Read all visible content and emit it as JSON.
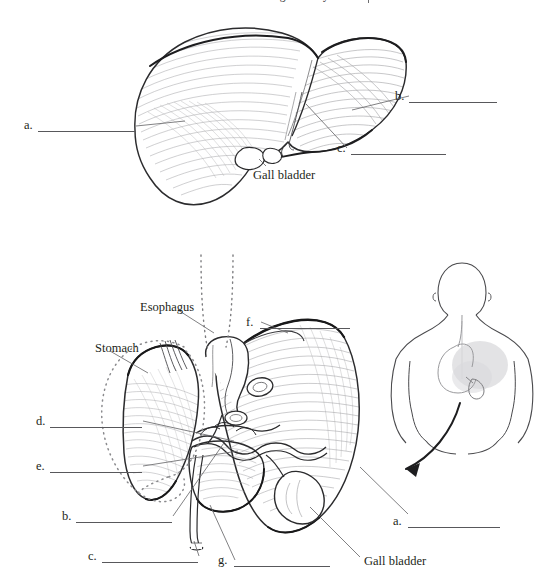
{
  "header": {
    "title": "Digestive System",
    "separator": "|",
    "badge_icon": "oval-badge-icon"
  },
  "figures": {
    "top": {
      "name": "liver-anterior-view",
      "labels": [
        {
          "key": "a.",
          "name": "label-a-top",
          "x": 24,
          "y": 125,
          "line_x": 38,
          "line_w": 98
        },
        {
          "key": "b.",
          "name": "label-b-top",
          "x": 395,
          "y": 96,
          "line_x": 409,
          "line_w": 88
        },
        {
          "key": "c.",
          "name": "label-c-top",
          "x": 337,
          "y": 148,
          "line_x": 351,
          "line_w": 95
        }
      ],
      "callouts": [
        {
          "name": "gall-bladder-callout-top",
          "text": "Gall bladder",
          "x": 253,
          "y": 168
        }
      ]
    },
    "bottom": {
      "name": "liver-posterior-view",
      "labels": [
        {
          "key": "d.",
          "name": "label-d-bottom",
          "x": 36,
          "y": 414,
          "line_x": 50,
          "line_w": 92
        },
        {
          "key": "e.",
          "name": "label-e-bottom",
          "x": 36,
          "y": 459,
          "line_x": 50,
          "line_w": 92
        },
        {
          "key": "b.",
          "name": "label-b-bottom",
          "x": 62,
          "y": 509,
          "line_x": 76,
          "line_w": 96
        },
        {
          "key": "c.",
          "name": "label-c-bottom",
          "x": 88,
          "y": 549,
          "line_x": 102,
          "line_w": 96
        },
        {
          "key": "f.",
          "name": "label-f-bottom",
          "x": 246,
          "y": 315,
          "line_x": 260,
          "line_w": 90
        },
        {
          "key": "g.",
          "name": "label-g-bottom",
          "x": 218,
          "y": 553,
          "line_x": 234,
          "line_w": 96
        },
        {
          "key": "a.",
          "name": "label-a-bottom",
          "x": 393,
          "y": 514,
          "line_x": 408,
          "line_w": 92
        }
      ],
      "callouts": [
        {
          "name": "esophagus-callout",
          "text": "Esophagus",
          "x": 140,
          "y": 300
        },
        {
          "name": "stomach-callout",
          "text": "Stomach",
          "x": 95,
          "y": 341
        },
        {
          "name": "gall-bladder-callout-bottom",
          "text": "Gall bladder",
          "x": 364,
          "y": 554
        }
      ]
    },
    "orientation": {
      "name": "human-torso-posterior-figure",
      "arrow": "curved-arrow-pointing-left"
    }
  },
  "colors": {
    "ink": "#231f20",
    "line": "#58585b",
    "hatch": "#8a8a8d",
    "organ_tint": "#d9d9dc",
    "background": "#ffffff"
  }
}
